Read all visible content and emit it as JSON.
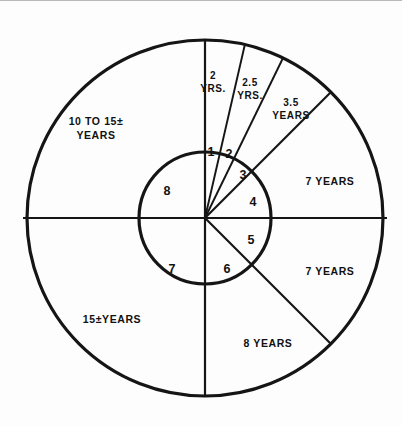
{
  "figure": {
    "background_color": "#fdfdfd",
    "line_color": "#151515"
  },
  "geometry": {
    "center_x": 205,
    "center_y": 217,
    "outer_radius": 178,
    "inner_radius": 66
  },
  "inner_ring": {
    "name": "inner-numbered-ring",
    "sectors": [
      {
        "id": "inner-sector-1",
        "label": "1",
        "start_deg": 0,
        "end_deg": 13,
        "label_x": 211,
        "label_y": 155
      },
      {
        "id": "inner-sector-2",
        "label": "2",
        "start_deg": 13,
        "end_deg": 26,
        "label_x": 229,
        "label_y": 156
      },
      {
        "id": "inner-sector-3",
        "label": "3",
        "start_deg": 26,
        "end_deg": 45,
        "label_x": 243,
        "label_y": 176
      },
      {
        "id": "inner-sector-4",
        "label": "4",
        "start_deg": 45,
        "end_deg": 90,
        "label_x": 253,
        "label_y": 203
      },
      {
        "id": "inner-sector-5",
        "label": "5",
        "start_deg": 90,
        "end_deg": 135,
        "label_x": 251,
        "label_y": 240
      },
      {
        "id": "inner-sector-6",
        "label": "6",
        "start_deg": 135,
        "end_deg": 180,
        "label_x": 227,
        "label_y": 268
      },
      {
        "id": "inner-sector-7",
        "label": "7",
        "start_deg": 180,
        "end_deg": 270,
        "label_x": 172,
        "label_y": 268
      },
      {
        "id": "inner-sector-8",
        "label": "8",
        "start_deg": 270,
        "end_deg": 360,
        "label_x": 167,
        "label_y": 191
      }
    ]
  },
  "outer_ring": {
    "name": "outer-years-ring",
    "sectors": [
      {
        "id": "outer-sector-2yrs",
        "lines": [
          "2",
          "YRS."
        ],
        "start_deg": 0,
        "end_deg": 13,
        "label_x": 213,
        "label_y": 78,
        "line_height": 13
      },
      {
        "id": "outer-sector-2-5yrs",
        "lines": [
          "2.5",
          "YRS."
        ],
        "start_deg": 13,
        "end_deg": 26,
        "label_x": 248,
        "label_y": 84,
        "line_height": 13
      },
      {
        "id": "outer-sector-3-5years",
        "lines": [
          "3.5",
          "YEARS"
        ],
        "start_deg": 26,
        "end_deg": 45,
        "label_x": 288,
        "label_y": 106,
        "line_height": 13
      },
      {
        "id": "outer-sector-7years-upper",
        "lines": [
          "7 YEARS"
        ],
        "start_deg": 45,
        "end_deg": 90,
        "label_x": 327,
        "label_y": 180,
        "line_height": 13
      },
      {
        "id": "outer-sector-7years-lower",
        "lines": [
          "7 YEARS"
        ],
        "start_deg": 90,
        "end_deg": 135,
        "label_x": 327,
        "label_y": 271,
        "line_height": 13
      },
      {
        "id": "outer-sector-8years",
        "lines": [
          "8 YEARS"
        ],
        "start_deg": 135,
        "end_deg": 180,
        "label_x": 267,
        "label_y": 343,
        "line_height": 13
      },
      {
        "id": "outer-sector-15years",
        "lines": [
          "15±YEARS"
        ],
        "start_deg": 180,
        "end_deg": 270,
        "label_x": 112,
        "label_y": 320,
        "line_height": 13
      },
      {
        "id": "outer-sector-10-to-15years",
        "lines": [
          "10 TO 15±",
          "YEARS"
        ],
        "start_deg": 270,
        "end_deg": 360,
        "label_x": 94,
        "label_y": 122,
        "line_height": 14
      }
    ]
  },
  "spokes": {
    "name": "radial-divider-lines",
    "inner_only_deg": [
      0,
      13,
      26
    ],
    "full_radius_deg": [
      45,
      90,
      135,
      180,
      270
    ],
    "outer_only_deg": []
  }
}
